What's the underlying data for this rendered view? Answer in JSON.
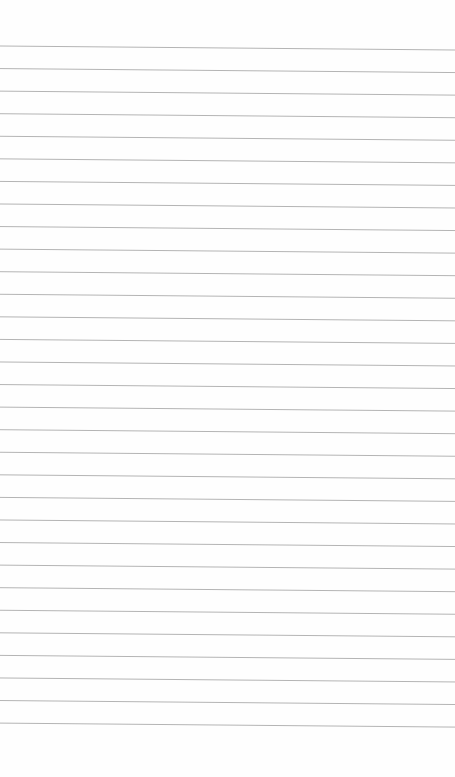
{
  "page": {
    "type": "lined-paper",
    "background_color": "#fefefe",
    "line_color": "#b4b4b4",
    "line_count": 31,
    "first_line_y_left": 46,
    "first_line_y_right": 50,
    "line_spacing": 22.57,
    "line_width": 1
  }
}
